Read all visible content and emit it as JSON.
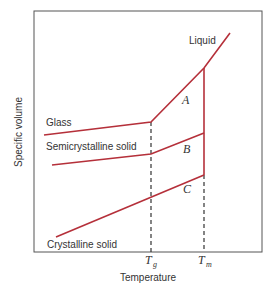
{
  "diagram": {
    "xlabel": "Temperature",
    "ylabel": "Specific volume",
    "colors": {
      "curve": "#b5303a",
      "frame": "#555555",
      "dashed": "#333333",
      "text": "#333333"
    },
    "curves": [
      {
        "name": "Liquid",
        "label": "Liquid"
      },
      {
        "name": "Glass",
        "label": "Glass"
      },
      {
        "name": "Semicrystalline solid",
        "label": "Semicrystalline solid"
      },
      {
        "name": "Crystalline solid",
        "label": "Crystalline solid"
      }
    ],
    "regions": [
      "A",
      "B",
      "C"
    ],
    "ticks": [
      {
        "main": "T",
        "sub": "g"
      },
      {
        "main": "T",
        "sub": "m"
      }
    ]
  }
}
